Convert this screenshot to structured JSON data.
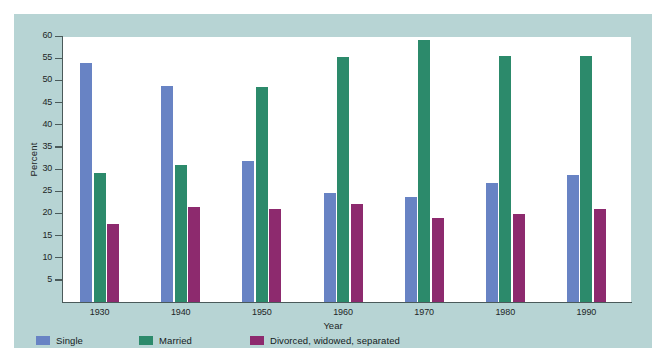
{
  "figure": {
    "background_color": "#b7d4d4",
    "plot_background_color": "#ffffff",
    "axis_color": "#4a5a5a"
  },
  "chart_data": {
    "type": "bar",
    "title": "",
    "xlabel": "Year",
    "ylabel": "Percent",
    "categories": [
      "1930",
      "1940",
      "1950",
      "1960",
      "1970",
      "1980",
      "1990"
    ],
    "ylim": [
      0,
      60
    ],
    "yticks": [
      5,
      10,
      15,
      20,
      25,
      30,
      35,
      40,
      45,
      50,
      55,
      60
    ],
    "ytick_labels": [
      "5",
      "10",
      "15",
      "20",
      "25",
      "30",
      "35",
      "40",
      "45",
      "50",
      "55",
      "60"
    ],
    "grid": false,
    "legend_position": "bottom-left",
    "series": [
      {
        "name": "Single",
        "color": "#6883c4",
        "values": [
          54.0,
          48.8,
          31.9,
          24.7,
          23.8,
          26.8,
          28.7
        ]
      },
      {
        "name": "Married",
        "color": "#2c8a6b",
        "values": [
          29.0,
          30.8,
          48.5,
          55.2,
          59.2,
          55.6,
          55.6
        ]
      },
      {
        "name": "Divorced, widowed, separated",
        "color": "#8d2a6e",
        "values": [
          17.5,
          21.5,
          21.0,
          22.2,
          19.0,
          19.8,
          21.0
        ]
      }
    ]
  }
}
